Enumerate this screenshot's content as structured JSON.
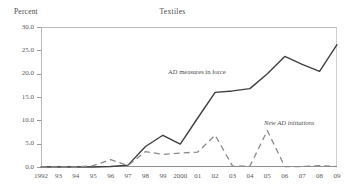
{
  "figure": {
    "ylabel": "Percent",
    "title": "Textiles"
  },
  "annotations": {
    "measures": "AD measures in force",
    "initiations": "New AD initiations"
  },
  "chart_data": {
    "type": "line",
    "title": "Textiles",
    "xlabel": "",
    "ylabel": "Percent",
    "ylim": [
      0.0,
      30.0
    ],
    "yticks": [
      "0.0",
      "5.0",
      "10.0",
      "15.0",
      "20.0",
      "25.0",
      "30.0"
    ],
    "ytick_values": [
      0.0,
      5.0,
      10.0,
      15.0,
      20.0,
      25.0,
      30.0
    ],
    "grid": false,
    "legend_position": "inline-annotations",
    "categories": [
      "1992",
      "93",
      "94",
      "95",
      "96",
      "97",
      "98",
      "99",
      "2000",
      "01",
      "02",
      "03",
      "04",
      "05",
      "06",
      "07",
      "08",
      "09"
    ],
    "category_values": [
      1992,
      1993,
      1994,
      1995,
      1996,
      1997,
      1998,
      1999,
      2000,
      2001,
      2002,
      2003,
      2004,
      2005,
      2006,
      2007,
      2008,
      2009
    ],
    "series": [
      {
        "name": "AD measures in force",
        "style": "solid",
        "color": "#3f3f3f",
        "values": [
          0.0,
          0.0,
          0.0,
          0.0,
          0.1,
          0.4,
          4.4,
          6.8,
          4.9,
          10.5,
          16.0,
          16.3,
          16.8,
          20.0,
          23.7,
          22.0,
          20.5,
          26.2
        ]
      },
      {
        "name": "New AD initiations",
        "style": "dashed",
        "color": "#8a8a8a",
        "values": [
          0.0,
          0.0,
          0.0,
          0.3,
          1.6,
          0.3,
          3.3,
          2.7,
          3.0,
          3.2,
          6.8,
          0.2,
          0.2,
          7.8,
          0.1,
          0.1,
          0.3,
          0.1
        ]
      }
    ]
  }
}
